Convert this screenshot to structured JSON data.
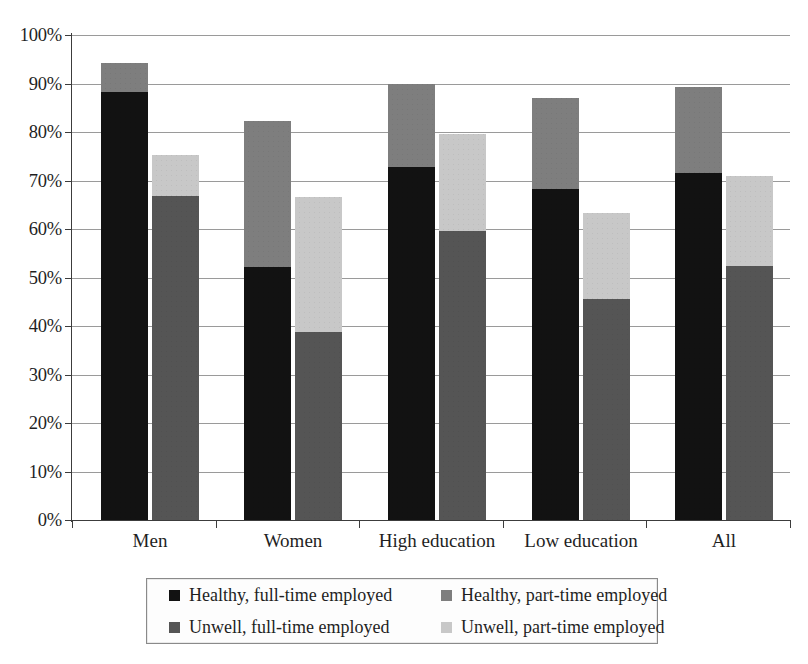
{
  "chart_data": {
    "type": "bar",
    "subtype": "grouped-stacked",
    "title": "",
    "subtitle": "",
    "xlabel": "",
    "ylabel": "",
    "ylim": [
      0,
      100
    ],
    "y_unit": "%",
    "grid": true,
    "legend_position": "bottom",
    "categories": [
      "Men",
      "Women",
      "High education",
      "Low education",
      "All"
    ],
    "y_ticks": [
      "0%",
      "10%",
      "20%",
      "30%",
      "40%",
      "50%",
      "60%",
      "70%",
      "80%",
      "90%",
      "100%"
    ],
    "y_tick_values": [
      0,
      10,
      20,
      30,
      40,
      50,
      60,
      70,
      80,
      90,
      100
    ],
    "series": [
      {
        "name": "Healthy, full-time employed",
        "color": "#121212",
        "stack": "healthy",
        "values": [
          88.2,
          52.2,
          72.7,
          68.2,
          71.5
        ]
      },
      {
        "name": "Healthy, part-time employed",
        "color": "#7e7e7e",
        "stack": "healthy",
        "values": [
          6.1,
          30.1,
          17.1,
          18.8,
          17.7
        ]
      },
      {
        "name": "Unwell, full-time employed",
        "color": "#555555",
        "stack": "unwell",
        "values": [
          66.9,
          38.7,
          59.6,
          45.5,
          52.4
        ]
      },
      {
        "name": "Unwell, part-time employed",
        "color": "#c8c8c8",
        "stack": "unwell",
        "values": [
          8.4,
          27.9,
          20.0,
          17.9,
          18.6
        ]
      }
    ],
    "stack_totals": {
      "healthy": [
        94.3,
        82.3,
        89.8,
        87.0,
        89.2
      ],
      "unwell": [
        75.3,
        66.6,
        79.6,
        63.4,
        71.0
      ]
    }
  },
  "legend": {
    "items": [
      {
        "label": "Healthy, full-time employed",
        "color": "#121212"
      },
      {
        "label": "Healthy, part-time employed",
        "color": "#7e7e7e"
      },
      {
        "label": "Unwell, full-time employed",
        "color": "#555555"
      },
      {
        "label": "Unwell, part-time employed",
        "color": "#c8c8c8"
      }
    ]
  },
  "axis": {
    "baseline_color": "#3c3c3c",
    "gridline_color": "#9a9a9a"
  }
}
